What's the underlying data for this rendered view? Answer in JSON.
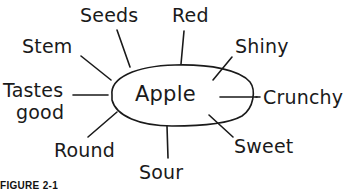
{
  "diagram": {
    "type": "concept-web",
    "center": "Apple",
    "branches": [
      {
        "id": "seeds",
        "label": "Seeds"
      },
      {
        "id": "red",
        "label": "Red"
      },
      {
        "id": "stem",
        "label": "Stem"
      },
      {
        "id": "shiny",
        "label": "Shiny"
      },
      {
        "id": "tastes-good",
        "label_line1": "Tastes",
        "label_line2": "good"
      },
      {
        "id": "crunchy",
        "label": "Crunchy"
      },
      {
        "id": "round",
        "label": "Round"
      },
      {
        "id": "sweet",
        "label": "Sweet"
      },
      {
        "id": "sour",
        "label": "Sour"
      }
    ],
    "colors": {
      "stroke": "#1a1a1a",
      "background": "#ffffff"
    }
  },
  "caption": "FIGURE 2-1"
}
